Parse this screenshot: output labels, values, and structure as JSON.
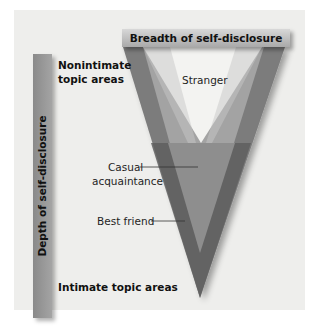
{
  "diagram": {
    "breadth_label": "Breadth of self-disclosure",
    "depth_label": "Depth of self-disclosure",
    "top_left_label_line1": "Nonintimate",
    "top_left_label_line2": "topic areas",
    "bottom_left_label": "Intimate topic areas",
    "regions": {
      "stranger": "Stranger",
      "casual_line1": "Casual",
      "casual_line2": "acquaintance",
      "best_friend": "Best friend"
    },
    "colors": {
      "panel": "#eeeeec",
      "outer_v": "#7a7a7a",
      "casual_band": "#5e5e5e",
      "inner_light": "#9c9c9c",
      "stranger_area": "#f4f4f2"
    }
  }
}
